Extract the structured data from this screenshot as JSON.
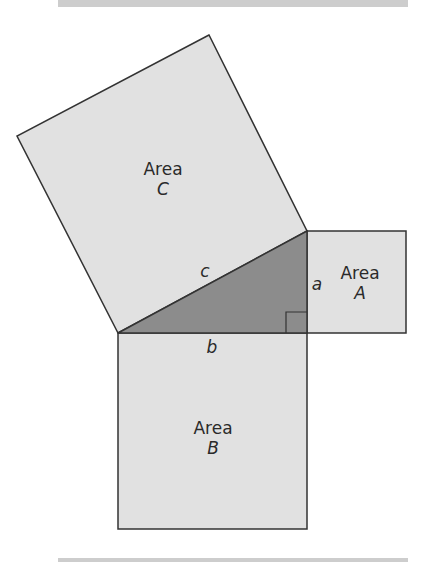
{
  "diagram": {
    "colors": {
      "square_fill": "#e1e1e1",
      "triangle_fill": "#8c8c8c",
      "stroke": "#333333",
      "bar": "#cdcdcd"
    },
    "squares": [
      {
        "id": "C",
        "label_line1": "Area",
        "label_line2": "C",
        "points": "209,35 17,136 118,333 307,231"
      },
      {
        "id": "A",
        "label_line1": "Area",
        "label_line2": "A",
        "points": "307,231 406,231 406,333 307,333"
      },
      {
        "id": "B",
        "label_line1": "Area",
        "label_line2": "B",
        "points": "118,333 307,333 307,529 118,529"
      }
    ],
    "triangle": {
      "points": "118,333 307,231 307,333"
    },
    "right_angle_marker": {
      "points": "286,333 286,312 307,312"
    },
    "sides": {
      "a": "a",
      "b": "b",
      "c": "c"
    }
  }
}
